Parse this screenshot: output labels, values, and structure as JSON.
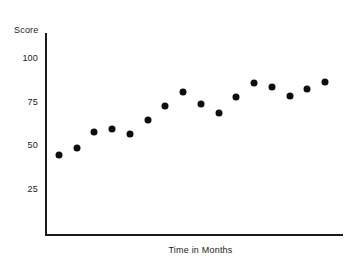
{
  "chart_data": {
    "type": "scatter",
    "title": "",
    "xlabel": "Time in Months",
    "ylabel": "Score",
    "x": [
      1,
      2,
      3,
      4,
      5,
      6,
      7,
      8,
      9,
      10,
      11,
      12,
      13,
      14,
      15,
      16
    ],
    "values": [
      45,
      49,
      58,
      60,
      57,
      65,
      73,
      81,
      74,
      69,
      78,
      86,
      84,
      79,
      83,
      87
    ],
    "ytick_labels": [
      "100",
      "75",
      "50",
      "25"
    ],
    "ytick_values": [
      100,
      75,
      50,
      25
    ],
    "xtick_labels": [],
    "ylim": [
      0,
      112
    ],
    "xlim": [
      0,
      17
    ],
    "grid": false,
    "legend": false,
    "marker": "filled-circle",
    "marker_color": "#0d0d0d",
    "axis_color": "#1a1a1a"
  },
  "axes": {
    "y_title": "Score",
    "x_title": "Time in Months"
  }
}
